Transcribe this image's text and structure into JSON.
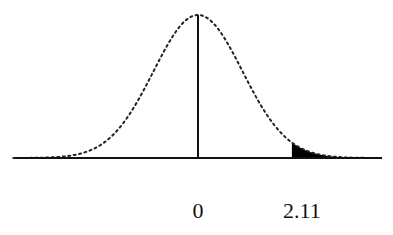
{
  "chart_data": {
    "type": "area",
    "title": "",
    "subtitle": "",
    "xlabel": "",
    "ylabel": "",
    "distribution": "standard-normal",
    "mean": 0,
    "sd": 1,
    "x_range": [
      -4.15,
      4.15
    ],
    "grid": false,
    "legend": null,
    "tick_labels": [
      {
        "value": 0,
        "label": "0"
      },
      {
        "value": 2.11,
        "label": "2.11"
      }
    ],
    "vertical_line_at": 0,
    "shaded_region": {
      "from": 2.11,
      "to": 4.15,
      "side": "right-tail",
      "color": "#000000"
    },
    "curve_style": "dotted",
    "colors": {
      "curve": "#222222",
      "axis": "#111111",
      "fill": "#000000",
      "background": "#ffffff"
    }
  },
  "labels": {
    "mean": "0",
    "critical_value": "2.11"
  }
}
